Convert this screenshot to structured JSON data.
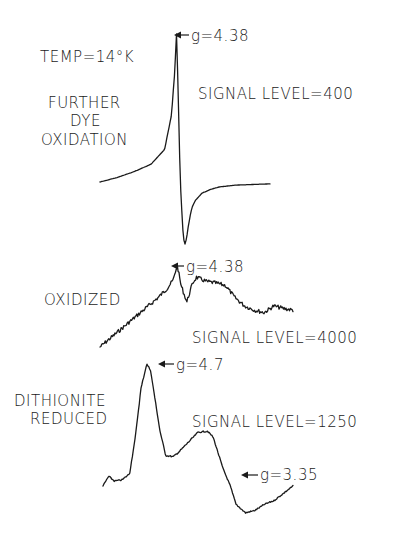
{
  "chart_data": {
    "type": "line",
    "title": "",
    "xlabel": "",
    "ylabel": "",
    "grid": false,
    "axes_shown": false,
    "annotations": {
      "temperature": "TEMP=14°K"
    },
    "panels": [
      {
        "id": "further-dye-oxidation",
        "label_lines": [
          "FURTHER",
          "DYE",
          "OXIDATION"
        ],
        "signal_level_text": "SIGNAL LEVEL=400",
        "signal_level": 400,
        "peaks": [
          {
            "label": "g=4.38",
            "g": 4.38,
            "kind": "derivative-max"
          }
        ],
        "shape": "derivative",
        "x": [
          0,
          0.1,
          0.2,
          0.3,
          0.38,
          0.42,
          0.44,
          0.45,
          0.46,
          0.47,
          0.48,
          0.49,
          0.5,
          0.51,
          0.52,
          0.53,
          0.54,
          0.56,
          0.6,
          0.65,
          0.7,
          0.8,
          0.9,
          1.0
        ],
        "y": [
          0.0,
          0.03,
          0.07,
          0.12,
          0.22,
          0.45,
          0.75,
          1.0,
          0.6,
          0.1,
          -0.4,
          -0.9,
          -1.0,
          -0.9,
          -0.7,
          -0.55,
          -0.42,
          -0.3,
          -0.18,
          -0.12,
          -0.08,
          -0.05,
          -0.04,
          -0.03
        ]
      },
      {
        "id": "oxidized",
        "label_lines": [
          "OXIDIZED"
        ],
        "signal_level_text": "SIGNAL LEVEL=4000",
        "signal_level": 4000,
        "peaks": [
          {
            "label": "g=4.38",
            "g": 4.38,
            "kind": "max"
          }
        ],
        "shape": "noisy",
        "x": [
          0,
          0.05,
          0.1,
          0.15,
          0.2,
          0.25,
          0.3,
          0.35,
          0.38,
          0.4,
          0.42,
          0.45,
          0.48,
          0.5,
          0.55,
          0.6,
          0.65,
          0.7,
          0.75,
          0.8,
          0.85,
          0.9,
          0.95,
          1.0
        ],
        "y": [
          0.0,
          0.1,
          0.2,
          0.3,
          0.4,
          0.5,
          0.6,
          0.72,
          0.82,
          1.0,
          0.75,
          0.55,
          0.78,
          0.85,
          0.8,
          0.78,
          0.75,
          0.6,
          0.5,
          0.45,
          0.42,
          0.5,
          0.47,
          0.45
        ]
      },
      {
        "id": "dithionite-reduced",
        "label_lines": [
          "DITHIONITE",
          "REDUCED"
        ],
        "signal_level_text": "SIGNAL LEVEL=1250",
        "signal_level": 1250,
        "peaks": [
          {
            "label": "g=4.7",
            "g": 4.7,
            "kind": "max"
          },
          {
            "label": "g=3.35",
            "g": 3.35,
            "kind": "shoulder"
          }
        ],
        "shape": "absorption",
        "x": [
          0,
          0.03,
          0.06,
          0.1,
          0.14,
          0.17,
          0.2,
          0.23,
          0.25,
          0.27,
          0.3,
          0.33,
          0.37,
          0.4,
          0.45,
          0.5,
          0.55,
          0.58,
          0.6,
          0.63,
          0.67,
          0.7,
          0.75,
          0.8,
          0.85,
          0.9,
          0.95,
          1.0
        ],
        "y": [
          0.0,
          0.08,
          0.04,
          0.05,
          0.1,
          0.4,
          0.8,
          1.0,
          0.95,
          0.75,
          0.45,
          0.25,
          0.24,
          0.28,
          0.36,
          0.44,
          0.45,
          0.4,
          0.3,
          0.15,
          0.0,
          -0.15,
          -0.22,
          -0.2,
          -0.15,
          -0.12,
          -0.06,
          0.0
        ]
      }
    ]
  }
}
